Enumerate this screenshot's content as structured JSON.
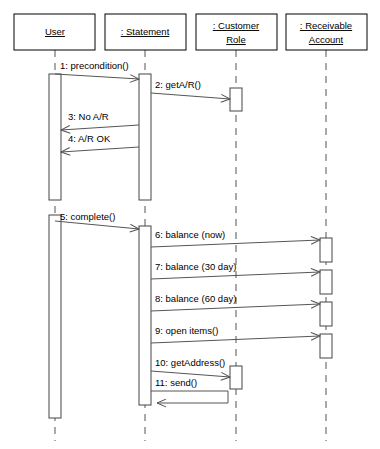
{
  "diagram": {
    "type": "uml-sequence-diagram",
    "width": 380,
    "height": 449,
    "background_color": "#ffffff",
    "line_color": "#555555",
    "text_color": "#000000"
  },
  "lifelines": [
    {
      "id": "user",
      "label": "User",
      "label_lines": [
        "User"
      ],
      "box": {
        "x": 14,
        "y": 14,
        "width": 81,
        "height": 36
      },
      "center_x": 55,
      "lifeline_bottom": 441
    },
    {
      "id": "statement",
      "label": ": Statement",
      "label_lines": [
        ": Statement"
      ],
      "box": {
        "x": 105,
        "y": 14,
        "width": 81,
        "height": 36
      },
      "center_x": 145,
      "lifeline_bottom": 441
    },
    {
      "id": "customer_role",
      "label": ": Customer Role",
      "label_lines": [
        ": Customer",
        "Role"
      ],
      "box": {
        "x": 196,
        "y": 14,
        "width": 81,
        "height": 36
      },
      "center_x": 236,
      "lifeline_bottom": 441
    },
    {
      "id": "receivable_account",
      "label": ": Receivable Account",
      "label_lines": [
        ": Receivable",
        "Account"
      ],
      "box": {
        "x": 286,
        "y": 14,
        "width": 81,
        "height": 36
      },
      "center_x": 326,
      "lifeline_bottom": 441
    }
  ],
  "activations": [
    {
      "id": "act-user-1",
      "lifeline": "user",
      "x": 49,
      "y": 74,
      "width": 12,
      "height": 126
    },
    {
      "id": "act-user-2",
      "lifeline": "user",
      "x": 49,
      "y": 215,
      "width": 12,
      "height": 203
    },
    {
      "id": "act-stmt-1",
      "lifeline": "statement",
      "x": 139,
      "y": 74,
      "width": 12,
      "height": 126
    },
    {
      "id": "act-stmt-2",
      "lifeline": "statement",
      "x": 139,
      "y": 226,
      "width": 12,
      "height": 179
    },
    {
      "id": "act-cust-1",
      "lifeline": "customer_role",
      "x": 230,
      "y": 88,
      "width": 12,
      "height": 23
    },
    {
      "id": "act-cust-2",
      "lifeline": "customer_role",
      "x": 230,
      "y": 366,
      "width": 12,
      "height": 23
    },
    {
      "id": "act-recv-1",
      "lifeline": "receivable_account",
      "x": 320,
      "y": 238,
      "width": 12,
      "height": 24
    },
    {
      "id": "act-recv-2",
      "lifeline": "receivable_account",
      "x": 320,
      "y": 270,
      "width": 12,
      "height": 24
    },
    {
      "id": "act-recv-3",
      "lifeline": "receivable_account",
      "x": 320,
      "y": 302,
      "width": 12,
      "height": 24
    },
    {
      "id": "act-recv-4",
      "lifeline": "receivable_account",
      "x": 320,
      "y": 334,
      "width": 12,
      "height": 24
    }
  ],
  "messages": [
    {
      "number": "1",
      "label": "1: precondition()",
      "from": "user",
      "to": "statement",
      "kind": "call",
      "direction": "right",
      "x1": 55,
      "x2": 139,
      "y": 74,
      "label_x": 60,
      "label_y": 69
    },
    {
      "number": "2",
      "label": "2: getA/R()",
      "from": "statement",
      "to": "customer_role",
      "kind": "call",
      "direction": "right",
      "x1": 151,
      "x2": 230,
      "y": 93,
      "label_x": 155,
      "label_y": 88
    },
    {
      "number": "3",
      "label": "3: No A/R",
      "from": "statement",
      "to": "user",
      "kind": "return",
      "direction": "left",
      "x1": 139,
      "x2": 61,
      "y": 125,
      "label_x": 68,
      "label_y": 120
    },
    {
      "number": "4",
      "label": "4: A/R OK",
      "from": "statement",
      "to": "user",
      "kind": "return",
      "direction": "left",
      "x1": 139,
      "x2": 61,
      "y": 147,
      "label_x": 68,
      "label_y": 142
    },
    {
      "number": "5",
      "label": "5: complete()",
      "from": "user",
      "to": "statement",
      "kind": "call",
      "direction": "right",
      "x1": 55,
      "x2": 139,
      "y": 226,
      "label_x": 60,
      "label_y": 220
    },
    {
      "number": "6",
      "label": "6: balance (now)",
      "from": "statement",
      "to": "receivable_account",
      "kind": "call",
      "direction": "right",
      "x1": 151,
      "x2": 320,
      "y": 243,
      "label_x": 155,
      "label_y": 238
    },
    {
      "number": "7",
      "label": "7: balance (30 day)",
      "from": "statement",
      "to": "receivable_account",
      "kind": "call",
      "direction": "right",
      "x1": 151,
      "x2": 320,
      "y": 275,
      "label_x": 155,
      "label_y": 270
    },
    {
      "number": "8",
      "label": "8: balance (60 day)",
      "from": "statement",
      "to": "receivable_account",
      "kind": "call",
      "direction": "right",
      "x1": 151,
      "x2": 320,
      "y": 307,
      "label_x": 155,
      "label_y": 302
    },
    {
      "number": "9",
      "label": "9: open items()",
      "from": "statement",
      "to": "receivable_account",
      "kind": "call",
      "direction": "right",
      "x1": 151,
      "x2": 320,
      "y": 339,
      "label_x": 155,
      "label_y": 334
    },
    {
      "number": "10",
      "label": "10: getAddress()",
      "from": "statement",
      "to": "customer_role",
      "kind": "call",
      "direction": "right",
      "x1": 151,
      "x2": 230,
      "y": 371,
      "label_x": 155,
      "label_y": 366
    },
    {
      "number": "11",
      "label": "11: send()",
      "from": "statement",
      "to": "statement",
      "kind": "self-call",
      "direction": "self",
      "x1": 151,
      "x2": 228,
      "y": 391,
      "y2": 403,
      "label_x": 155,
      "label_y": 386
    }
  ]
}
